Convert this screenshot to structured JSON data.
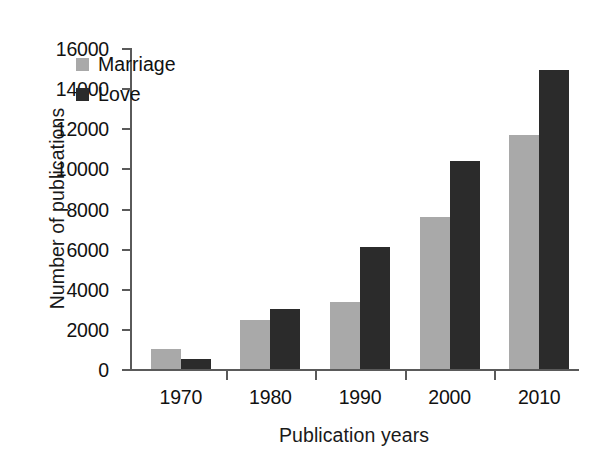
{
  "chart_data": {
    "type": "bar",
    "title": "",
    "subtitle": "",
    "xlabel": "Publication years",
    "ylabel": "Number of publications",
    "categories": [
      "1970",
      "1980",
      "1990",
      "2000",
      "2010"
    ],
    "series": [
      {
        "name": "Marriage",
        "color": "#a9a9a9",
        "values": [
          1000,
          2450,
          3350,
          7600,
          11650
        ]
      },
      {
        "name": "Love",
        "color": "#2b2b2b",
        "values": [
          500,
          3000,
          6100,
          10350,
          14900
        ]
      }
    ],
    "ylim": [
      0,
      16000
    ],
    "ytick_values": [
      0,
      2000,
      4000,
      6000,
      8000,
      10000,
      12000,
      14000,
      16000
    ],
    "ytick_labels": [
      "0",
      "2000",
      "4000",
      "6000",
      "8000",
      "10000",
      "12000",
      "14000",
      "16000"
    ],
    "grid": false,
    "legend_position": "upper-left-inside",
    "legend_entries": [
      "Marriage",
      "Love"
    ],
    "background_color": "#ffffff",
    "axis_color": "#5a5a5a",
    "text_color": "#111111"
  }
}
